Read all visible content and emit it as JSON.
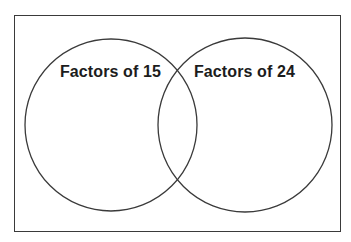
{
  "diagram": {
    "type": "venn",
    "sets": [
      {
        "id": "left",
        "label": "Factors of 15",
        "members": []
      },
      {
        "id": "right",
        "label": "Factors of 24",
        "members": []
      }
    ],
    "overlap": {
      "members": []
    },
    "colors": {
      "stroke": "#3a3a3a",
      "text": "#1c1c1c",
      "background": "#ffffff"
    }
  }
}
